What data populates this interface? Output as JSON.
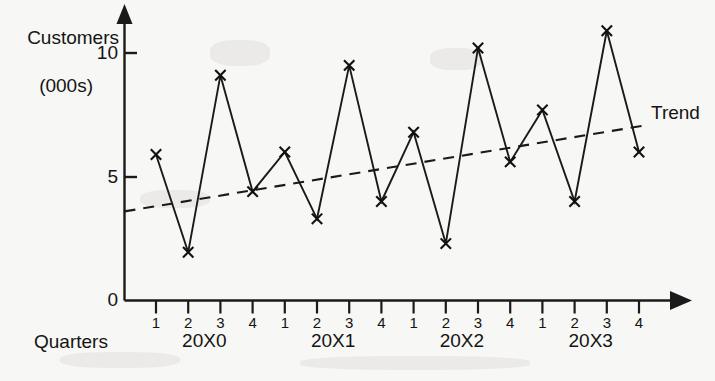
{
  "chart_data": {
    "type": "line",
    "title": "",
    "ylabel_line1": "Customers",
    "ylabel_line2": "(000s)",
    "xlabel": "Quarters",
    "ylim": [
      0,
      11.5
    ],
    "y_ticks": [
      "0",
      "5",
      "10"
    ],
    "y_tick_values": [
      0,
      5,
      10
    ],
    "grid": false,
    "legend_position": "inline-right",
    "x_tick_labels": [
      "1",
      "2",
      "3",
      "4",
      "1",
      "2",
      "3",
      "4",
      "1",
      "2",
      "3",
      "4",
      "1",
      "2",
      "3",
      "4"
    ],
    "group_labels": [
      "20X0",
      "20X1",
      "20X2",
      "20X3"
    ],
    "categories": [
      "20X0 Q1",
      "20X0 Q2",
      "20X0 Q3",
      "20X0 Q4",
      "20X1 Q1",
      "20X1 Q2",
      "20X1 Q3",
      "20X1 Q4",
      "20X2 Q1",
      "20X2 Q2",
      "20X2 Q3",
      "20X2 Q4",
      "20X3 Q1",
      "20X3 Q2",
      "20X3 Q3",
      "20X3 Q4"
    ],
    "series": [
      {
        "name": "Customers",
        "marker": "x",
        "style": "solid",
        "values": [
          5.9,
          1.95,
          9.1,
          4.4,
          6.0,
          3.3,
          9.5,
          4.0,
          6.8,
          2.3,
          10.2,
          5.6,
          7.7,
          4.0,
          10.9,
          6.0
        ]
      },
      {
        "name": "Trend",
        "marker": "none",
        "style": "dashed",
        "endpoints": [
          {
            "x": "start",
            "value": 3.6
          },
          {
            "x": "end",
            "value": 7.1
          }
        ]
      }
    ],
    "annotations": [
      {
        "name": "trend-label",
        "text": "Trend"
      }
    ]
  },
  "labels": {
    "trend": "Trend"
  }
}
